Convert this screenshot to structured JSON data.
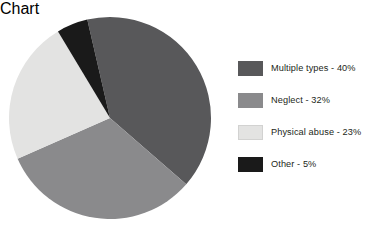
{
  "chart_data": {
    "type": "pie",
    "title": "",
    "subtitle": "",
    "xlabel": "",
    "ylabel": "",
    "grid": false,
    "legend_position": "right",
    "start_angle_deg": -13,
    "direction": "clockwise",
    "categories": [
      "Multiple types",
      "Neglect",
      "Physical abuse",
      "Other"
    ],
    "values": [
      40,
      32,
      23,
      5
    ],
    "value_unit": "%",
    "labels": [
      "Multiple types - 40%",
      "Neglect - 32%",
      "Physical abuse - 23%",
      "Other - 5%"
    ],
    "colors": [
      "#58585a",
      "#8a8a8c",
      "#e3e3e2",
      "#1a1a1a"
    ],
    "slices": [
      {
        "name": "Multiple types",
        "value": 40,
        "color": "#58585a",
        "label": "Multiple types - 40%"
      },
      {
        "name": "Neglect",
        "value": 32,
        "color": "#8a8a8c",
        "label": "Neglect - 32%"
      },
      {
        "name": "Physical abuse",
        "value": 23,
        "color": "#e3e3e2",
        "label": "Physical abuse - 23%"
      },
      {
        "name": "Other",
        "value": 5,
        "color": "#1a1a1a",
        "label": "Other - 5%"
      }
    ]
  },
  "legend": {
    "items": [
      {
        "label": "Multiple types - 40%",
        "color": "#58585a"
      },
      {
        "label": "Neglect - 32%",
        "color": "#8a8a8c"
      },
      {
        "label": "Physical abuse - 23%",
        "color": "#e3e3e2"
      },
      {
        "label": "Other - 5%",
        "color": "#1a1a1a"
      }
    ]
  },
  "geometry": {
    "center_x": 110,
    "center_y": 118,
    "radius": 101
  }
}
